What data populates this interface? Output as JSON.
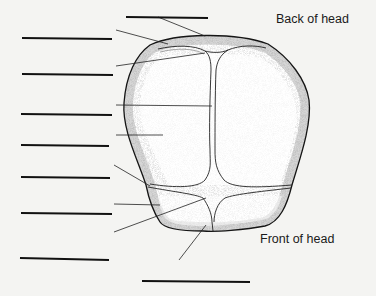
{
  "diagram": {
    "captions": {
      "back": "Back of head",
      "front": "Front of head"
    },
    "answer_blanks": [
      {
        "id": 1,
        "x1": 126,
        "y1": 17,
        "x2": 208,
        "y2": 18
      },
      {
        "id": 2,
        "x1": 22,
        "y1": 38,
        "x2": 112,
        "y2": 39
      },
      {
        "id": 3,
        "x1": 22,
        "y1": 74,
        "x2": 113,
        "y2": 75
      },
      {
        "id": 4,
        "x1": 21,
        "y1": 114,
        "x2": 112,
        "y2": 115
      },
      {
        "id": 5,
        "x1": 21,
        "y1": 145,
        "x2": 109,
        "y2": 146
      },
      {
        "id": 6,
        "x1": 21,
        "y1": 177,
        "x2": 110,
        "y2": 178
      },
      {
        "id": 7,
        "x1": 21,
        "y1": 213,
        "x2": 112,
        "y2": 214
      },
      {
        "id": 8,
        "x1": 20,
        "y1": 258,
        "x2": 109,
        "y2": 260
      },
      {
        "id": 9,
        "x1": 142,
        "y1": 281,
        "x2": 250,
        "y2": 282
      }
    ],
    "leader_lines": [
      {
        "target": "posterior-fontanelle",
        "x1": 158,
        "y1": 17,
        "x2": 205,
        "y2": 36
      },
      {
        "target": "lambdoid-suture",
        "x1": 116,
        "y1": 30,
        "x2": 168,
        "y2": 44
      },
      {
        "target": "occipital-bone",
        "x1": 116,
        "y1": 66,
        "x2": 205,
        "y2": 53
      },
      {
        "target": "sagittal-suture",
        "x1": 116,
        "y1": 105,
        "x2": 212,
        "y2": 106
      },
      {
        "target": "parietal-bone",
        "x1": 116,
        "y1": 135,
        "x2": 163,
        "y2": 135
      },
      {
        "target": "coronal-suture",
        "x1": 114,
        "y1": 165,
        "x2": 150,
        "y2": 186
      },
      {
        "target": "frontal-bone",
        "x1": 114,
        "y1": 204,
        "x2": 160,
        "y2": 205
      },
      {
        "target": "anterior-fontanelle",
        "x1": 114,
        "y1": 232,
        "x2": 206,
        "y2": 198
      },
      {
        "target": "frontal-suture",
        "x1": 179,
        "y1": 260,
        "x2": 206,
        "y2": 225
      }
    ],
    "colors": {
      "background": "#f4f4f2",
      "ink": "#151515",
      "stipple": "#9a9a9a"
    }
  }
}
